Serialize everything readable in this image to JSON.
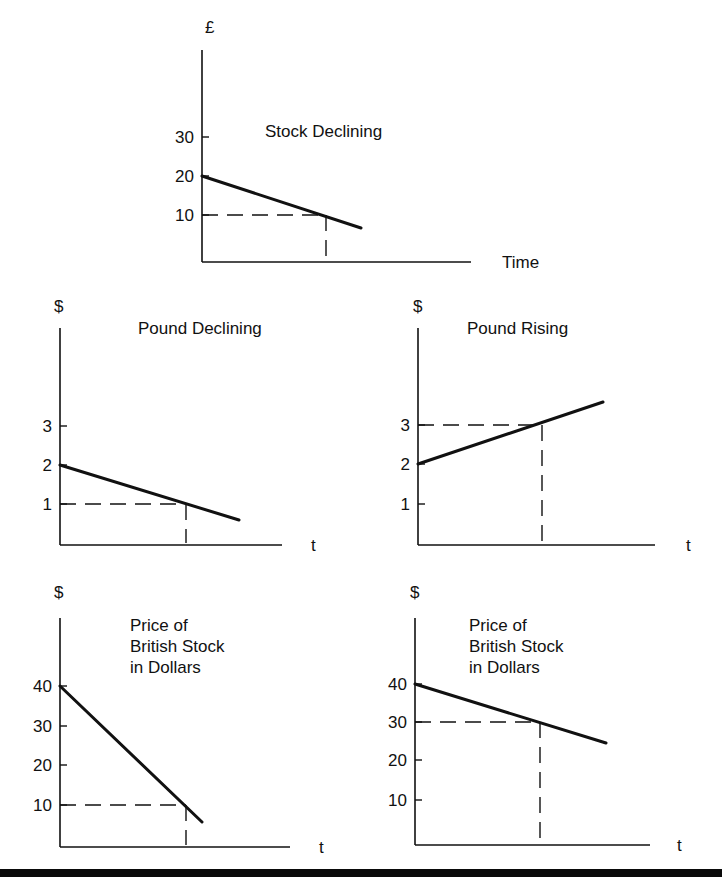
{
  "figure": {
    "bottom_rule_color": "#0a0a0a",
    "line_color": "#111111"
  },
  "charts": [
    {
      "id": "stock",
      "title": "Stock Declining",
      "y_unit": "£",
      "x_label": "Time",
      "y_ticks": [
        "30",
        "20",
        "10"
      ],
      "box": {
        "x0": 202,
        "yTop": 50,
        "xEnd": 471,
        "yAxis": 262
      },
      "tick_px": [
        137,
        176,
        215
      ],
      "line": [
        [
          202,
          176
        ],
        [
          361,
          228
        ]
      ],
      "dash": {
        "y": 215,
        "x": 326
      }
    },
    {
      "id": "pound-declining",
      "title": "Pound Declining",
      "y_unit": "$",
      "x_label": "t",
      "y_ticks": [
        "3",
        "2",
        "1"
      ],
      "box": {
        "x0": 60,
        "yTop": 328,
        "xEnd": 282,
        "yAxis": 545
      },
      "tick_px": [
        426,
        465,
        504
      ],
      "line": [
        [
          60,
          465
        ],
        [
          239,
          520
        ]
      ],
      "dash": {
        "y": 504,
        "x": 186
      }
    },
    {
      "id": "pound-rising",
      "title": "Pound Rising",
      "y_unit": "$",
      "x_label": "t",
      "y_ticks": [
        "3",
        "2",
        "1"
      ],
      "box": {
        "x0": 418,
        "yTop": 328,
        "xEnd": 655,
        "yAxis": 545
      },
      "tick_px": [
        425,
        464,
        504
      ],
      "line": [
        [
          418,
          464
        ],
        [
          603,
          402
        ]
      ],
      "dash": {
        "y": 425,
        "x": 542
      }
    },
    {
      "id": "british-stock-pound-declining",
      "title_lines": [
        "Price of",
        "British Stock",
        "in Dollars"
      ],
      "y_unit": "$",
      "x_label": "t",
      "y_ticks": [
        "40",
        "30",
        "20",
        "10"
      ],
      "box": {
        "x0": 60,
        "yTop": 618,
        "xEnd": 290,
        "yAxis": 847
      },
      "tick_px": [
        686,
        726,
        765,
        805
      ],
      "line": [
        [
          60,
          686
        ],
        [
          202,
          822
        ]
      ],
      "dash": {
        "y": 805,
        "x": 186
      }
    },
    {
      "id": "british-stock-pound-rising",
      "title_lines": [
        "Price of",
        "British Stock",
        "in Dollars"
      ],
      "y_unit": "$",
      "x_label": "t",
      "y_ticks": [
        "40",
        "30",
        "20",
        "10"
      ],
      "box": {
        "x0": 415,
        "yTop": 618,
        "xEnd": 650,
        "yAxis": 845
      },
      "tick_px": [
        684,
        722,
        760,
        800
      ],
      "line": [
        [
          415,
          684
        ],
        [
          606,
          743
        ]
      ],
      "dash": {
        "y": 722,
        "x": 540
      }
    }
  ],
  "chart_data": [
    {
      "type": "line",
      "title": "Stock Declining",
      "xlabel": "Time",
      "ylabel": "£",
      "y_ticks": [
        10,
        20,
        30
      ],
      "ylim": [
        0,
        30
      ],
      "series": [
        {
          "name": "Stock price (£)",
          "x": [
            0,
            1,
            1.3
          ],
          "values": [
            20,
            10,
            7
          ]
        }
      ],
      "annotations": [
        {
          "type": "dashed-guide",
          "y": 10,
          "x": 1
        }
      ],
      "grid": false
    },
    {
      "type": "line",
      "title": "Pound Declining",
      "xlabel": "t",
      "ylabel": "$",
      "y_ticks": [
        1,
        2,
        3
      ],
      "ylim": [
        0,
        3
      ],
      "series": [
        {
          "name": "Pound ($)",
          "x": [
            0,
            1,
            1.4
          ],
          "values": [
            2,
            1,
            0.6
          ]
        }
      ],
      "annotations": [
        {
          "type": "dashed-guide",
          "y": 1,
          "x": 1
        }
      ],
      "grid": false
    },
    {
      "type": "line",
      "title": "Pound Rising",
      "xlabel": "t",
      "ylabel": "$",
      "y_ticks": [
        1,
        2,
        3
      ],
      "ylim": [
        0,
        3.6
      ],
      "series": [
        {
          "name": "Pound ($)",
          "x": [
            0,
            1,
            1.5
          ],
          "values": [
            2,
            3,
            3.6
          ]
        }
      ],
      "annotations": [
        {
          "type": "dashed-guide",
          "y": 3,
          "x": 1
        }
      ],
      "grid": false
    },
    {
      "type": "line",
      "title": "Price of British Stock in Dollars",
      "xlabel": "t",
      "ylabel": "$",
      "y_ticks": [
        10,
        20,
        30,
        40
      ],
      "ylim": [
        0,
        40
      ],
      "series": [
        {
          "name": "British stock ($)",
          "x": [
            0,
            1,
            1.13
          ],
          "values": [
            40,
            10,
            6
          ]
        }
      ],
      "annotations": [
        {
          "type": "dashed-guide",
          "y": 10,
          "x": 1
        }
      ],
      "grid": false
    },
    {
      "type": "line",
      "title": "Price of British Stock in Dollars",
      "xlabel": "t",
      "ylabel": "$",
      "y_ticks": [
        10,
        20,
        30,
        40
      ],
      "ylim": [
        0,
        40
      ],
      "series": [
        {
          "name": "British stock ($)",
          "x": [
            0,
            1,
            1.52
          ],
          "values": [
            40,
            30,
            25
          ]
        }
      ],
      "annotations": [
        {
          "type": "dashed-guide",
          "y": 30,
          "x": 1
        }
      ],
      "grid": false
    }
  ]
}
